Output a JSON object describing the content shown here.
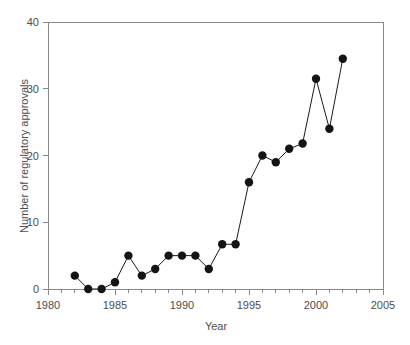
{
  "chart_data": {
    "type": "line",
    "title": "",
    "xlabel": "Year",
    "ylabel": "Number of regulatory approvals",
    "xlim": [
      1980,
      2005
    ],
    "ylim": [
      0,
      40
    ],
    "grid": false,
    "legend": "none",
    "marker": "filled-circle",
    "x_ticks_major": [
      1980,
      1985,
      1990,
      1995,
      2000,
      2005
    ],
    "x_tick_labels": [
      "1980",
      "1985",
      "1990",
      "1995",
      "2000",
      "2005"
    ],
    "x_ticks_minor_step": 1,
    "y_ticks": [
      0,
      10,
      20,
      30,
      40
    ],
    "y_tick_labels": [
      "0",
      "10",
      "20",
      "30",
      "40"
    ],
    "x": [
      1982,
      1983,
      1984,
      1985,
      1986,
      1987,
      1988,
      1989,
      1990,
      1991,
      1992,
      1993,
      1994,
      1995,
      1996,
      1997,
      1998,
      1999,
      2000,
      2001,
      2002
    ],
    "values": [
      2,
      0,
      0,
      1,
      5,
      2,
      3,
      5,
      5,
      5,
      3,
      6.7,
      6.7,
      16,
      20,
      19,
      21,
      21.8,
      31.5,
      24,
      34.5
    ],
    "series": [
      {
        "name": "Regulatory approvals",
        "values": [
          2,
          0,
          0,
          1,
          5,
          2,
          3,
          5,
          5,
          5,
          3,
          6.7,
          6.7,
          16,
          20,
          19,
          21,
          21.8,
          31.5,
          24,
          34.5
        ]
      }
    ]
  },
  "colors": {
    "line": "#1a1a1a",
    "marker": "#141414",
    "axis": "#8a8a8a",
    "text": "#4d4d4d",
    "background": "#ffffff"
  }
}
